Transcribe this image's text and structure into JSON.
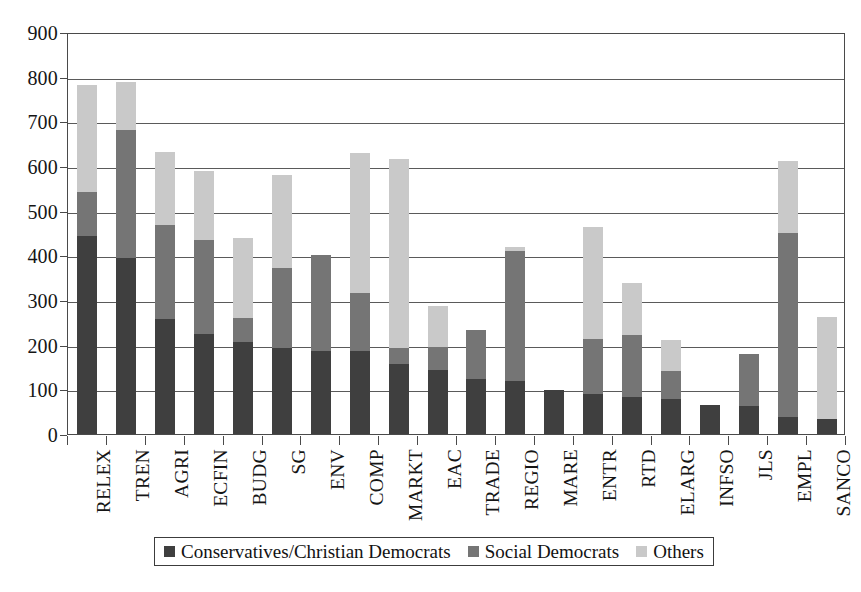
{
  "chart_data": {
    "type": "bar",
    "subtype": "stacked-vertical",
    "title": "",
    "xlabel": "",
    "ylabel": "",
    "ylim": [
      0,
      900
    ],
    "ytick_step": 100,
    "yticks": [
      900,
      800,
      700,
      600,
      500,
      400,
      300,
      200,
      100,
      0
    ],
    "grid": true,
    "legend_position": "bottom-center",
    "categories": [
      "RELEX",
      "TREN",
      "AGRI",
      "ECFIN",
      "BUDG",
      "SG",
      "ENV",
      "COMP",
      "MARKT",
      "EAC",
      "TRADE",
      "REGIO",
      "MARE",
      "ENTR",
      "RTD",
      "ELARG",
      "INFSO",
      "JLS",
      "EMPL",
      "SANCO"
    ],
    "series": [
      {
        "name": "Conservatives/Christian Democrats",
        "color": "#3f3f3f",
        "values": [
          443,
          394,
          258,
          224,
          207,
          192,
          185,
          185,
          157,
          143,
          124,
          118,
          99,
          90,
          83,
          78,
          64,
          62,
          38,
          33
        ]
      },
      {
        "name": "Social Democrats",
        "color": "#757575",
        "values": [
          99,
          286,
          209,
          210,
          53,
          179,
          215,
          130,
          36,
          51,
          109,
          292,
          0,
          122,
          139,
          62,
          0,
          118,
          412,
          0
        ]
      },
      {
        "name": "Others",
        "color": "#c9c9c9",
        "values": [
          240,
          108,
          165,
          155,
          179,
          209,
          0,
          315,
          422,
          93,
          0,
          8,
          0,
          251,
          115,
          70,
          0,
          0,
          162,
          230
        ]
      }
    ],
    "totals": [
      782,
      788,
      632,
      589,
      439,
      580,
      400,
      630,
      615,
      287,
      233,
      418,
      99,
      463,
      337,
      210,
      64,
      180,
      612,
      263
    ]
  },
  "legend": {
    "entries": [
      {
        "label": "Conservatives/Christian Democrats",
        "color": "#3f3f3f"
      },
      {
        "label": "Social Democrats",
        "color": "#757575"
      },
      {
        "label": "Others",
        "color": "#c9c9c9"
      }
    ]
  }
}
